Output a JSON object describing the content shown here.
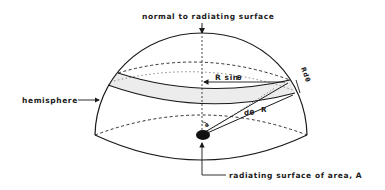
{
  "diagram": {
    "type": "hemisphere radiation geometry",
    "labels": {
      "normal": "normal to radiating surface",
      "hemisphere": "hemisphere",
      "source": "radiating surface of area, A",
      "r_sin": "R sin",
      "theta_symbol": "θ",
      "r": "R",
      "d_theta": "dθ",
      "r_d_theta": "Rdθ"
    },
    "colors": {
      "ink": "#1a1a1a",
      "band_fill": "#ececec",
      "background": "#ffffff"
    }
  }
}
